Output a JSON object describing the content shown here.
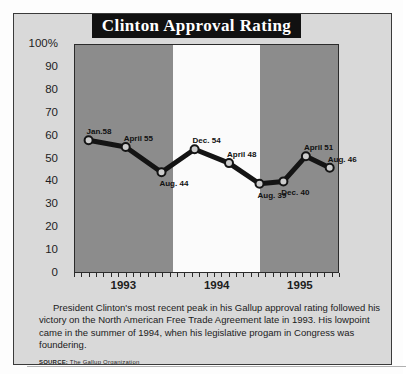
{
  "title": "Clinton Approval Rating",
  "caption": "President Clinton's most recent peak in his Gallup approval  rating  followed his victory on the North American Free Trade Agreement late in 1993. His lowpoint came in the summer of 1994, when his legislative progam in Congress was foundering.",
  "source_label": "SOURCE:",
  "source_text": "The Gallup Organization",
  "colors": {
    "banner_bg": "#111111",
    "banner_text": "#ffffff",
    "card_bg": "#d9d9d9",
    "plot_band_gray": "#8c8c8c",
    "plot_band_white": "#fbfbfb",
    "line": "#141414",
    "marker_fill": "#cccccc",
    "frame": "#2b2b2b"
  },
  "chart_data": {
    "type": "line",
    "title": "Clinton Approval Rating",
    "xlabel": "",
    "ylabel": "",
    "ylim": [
      0,
      100
    ],
    "yticks": [
      "100%",
      "90",
      "80",
      "70",
      "60",
      "50",
      "40",
      "30",
      "20",
      "10",
      "0"
    ],
    "ytick_values": [
      100,
      90,
      80,
      70,
      60,
      50,
      40,
      30,
      20,
      10,
      0
    ],
    "xticks": [
      "1993",
      "1994",
      "1995"
    ],
    "x_minor_ticks_per_year": 12,
    "grid": false,
    "legend": "none",
    "bands": [
      {
        "label": "1993",
        "shade": "gray"
      },
      {
        "label": "1994",
        "shade": "white"
      },
      {
        "label": "1995",
        "shade": "gray"
      }
    ],
    "points": [
      {
        "label": "Jan.58",
        "period": "Jan 1993",
        "value": 58,
        "x": 0.055,
        "label_pos": "above-right"
      },
      {
        "label": "April 55",
        "period": "April 1993",
        "value": 55,
        "x": 0.195,
        "label_pos": "above-right"
      },
      {
        "label": "Aug. 44",
        "period": "Aug 1993",
        "value": 44,
        "x": 0.33,
        "label_pos": "below-right"
      },
      {
        "label": "Dec. 54",
        "period": "Dec 1993",
        "value": 54,
        "x": 0.455,
        "label_pos": "above-right"
      },
      {
        "label": "April 48",
        "period": "April 1994",
        "value": 48,
        "x": 0.585,
        "label_pos": "above-right"
      },
      {
        "label": "Aug. 39",
        "period": "Aug 1994",
        "value": 39,
        "x": 0.7,
        "label_pos": "below-right"
      },
      {
        "label": "Dec. 40",
        "period": "Dec 1994",
        "value": 40,
        "x": 0.79,
        "label_pos": "below-right"
      },
      {
        "label": "April 51",
        "period": "April 1995",
        "value": 51,
        "x": 0.875,
        "label_pos": "above-right"
      },
      {
        "label": "Aug. 46",
        "period": "Aug 1995",
        "value": 46,
        "x": 0.965,
        "label_pos": "above-right"
      }
    ]
  }
}
